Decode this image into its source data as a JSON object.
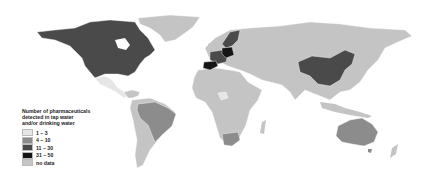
{
  "figure": {
    "type": "choropleth-world-map",
    "title": "Number of pharmaceuticals detected in tap water and/or drinking water"
  },
  "legend": {
    "title_lines": [
      "Number of pharmaceuticals",
      "detected in tap water",
      "and/or drinking water"
    ],
    "items": [
      {
        "label": "1 – 3",
        "color": "#e6e6e6"
      },
      {
        "label": "4 – 10",
        "color": "#8c8c8c"
      },
      {
        "label": "11 – 30",
        "color": "#4a4a4a"
      },
      {
        "label": "31 – 50",
        "color": "#151515"
      },
      {
        "label": "no data",
        "color": "#c4c4c4"
      }
    ]
  },
  "regions": {
    "canada_usa": {
      "category": "11 – 30",
      "color": "#4a4a4a"
    },
    "western_europe": {
      "category": "11 – 30",
      "color": "#4a4a4a"
    },
    "germany_spain": {
      "category": "31 – 50",
      "color": "#151515"
    },
    "china": {
      "category": "11 – 30",
      "color": "#4a4a4a"
    },
    "brazil": {
      "category": "4 – 10",
      "color": "#8c8c8c"
    },
    "south_africa": {
      "category": "4 – 10",
      "color": "#8c8c8c"
    },
    "australia": {
      "category": "4 – 10",
      "color": "#8c8c8c"
    },
    "mexico": {
      "category": "1 – 3",
      "color": "#e6e6e6"
    },
    "nigeria": {
      "category": "1 – 3",
      "color": "#e6e6e6"
    },
    "rest_of_world": {
      "category": "no data",
      "color": "#c4c4c4"
    }
  }
}
